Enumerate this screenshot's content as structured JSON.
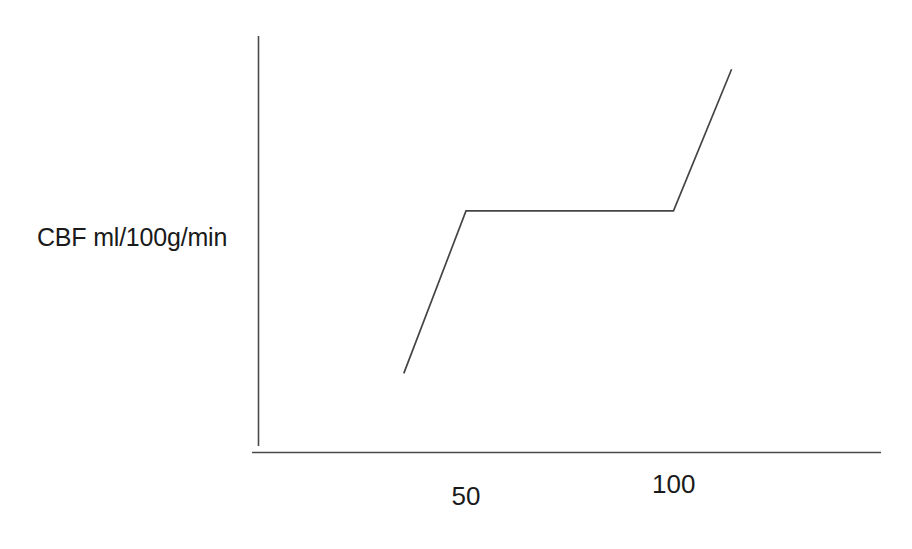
{
  "chart_data": {
    "type": "line",
    "title": "",
    "subtitle": "",
    "xlabel": "",
    "ylabel": "CBF ml/100g/min",
    "x_tick_labels": [
      "50",
      "100"
    ],
    "x_tick_values": [
      50,
      100
    ],
    "y_tick_labels": [],
    "xlim": [
      0,
      150
    ],
    "ylim": [
      0,
      100
    ],
    "grid": false,
    "legend": null,
    "legend_position": "none",
    "annotations": [],
    "series": [
      {
        "name": "Cerebral blood flow autoregulation curve",
        "x": [
          35,
          50,
          100,
          114
        ],
        "y": [
          19,
          58,
          58,
          92
        ],
        "color": "#454545",
        "line_width": 1.7,
        "markers": "none"
      }
    ],
    "axes": {
      "x_axis_color": "#4a4a4a",
      "y_axis_color": "#4a4a4a",
      "x_axis_visible": true,
      "y_axis_visible": true,
      "top_spine": false,
      "right_spine": false,
      "ticks_visible": false
    }
  },
  "labels": {
    "y_axis_label": "CBF ml/100g/min",
    "x_tick_50": "50",
    "x_tick_100": "100"
  },
  "colors": {
    "background": "#ffffff",
    "text": "#1a1a1a",
    "axis": "#4a4a4a",
    "curve": "#454545"
  }
}
